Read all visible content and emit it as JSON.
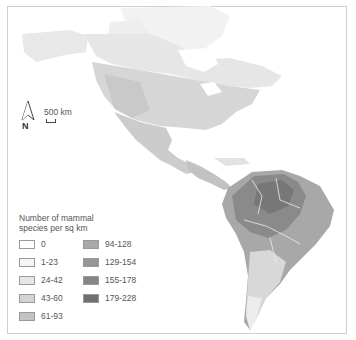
{
  "map": {
    "subject": "Number of mammal species per sq km across the Americas",
    "north_arrow_label": "N",
    "scale_label": "500 km",
    "colors": {
      "frame_border": "#cfcfcf",
      "ocean": "#ffffff",
      "greenland": "#f2f2f2",
      "canada_north": "#ececec",
      "north_america": "#dddddd",
      "usa_west": "#cfcfcf",
      "central_america": "#c8c8c8",
      "amazon": "#8e8e8e",
      "brazil_east": "#a8a8a8",
      "southern_cone": "#dcdcdc",
      "patagonia": "#eeeeee"
    }
  },
  "legend": {
    "title": "Number of mammal species per sq km",
    "items": [
      {
        "label": "0",
        "color": "#ffffff"
      },
      {
        "label": "1-23",
        "color": "#f5f5f5"
      },
      {
        "label": "24-42",
        "color": "#e6e6e6"
      },
      {
        "label": "43-60",
        "color": "#d3d3d3"
      },
      {
        "label": "61-93",
        "color": "#c2c2c2"
      },
      {
        "label": "94-128",
        "color": "#a9a9a9"
      },
      {
        "label": "129-154",
        "color": "#969696"
      },
      {
        "label": "155-178",
        "color": "#858585"
      },
      {
        "label": "179-228",
        "color": "#6f6f6f"
      }
    ]
  }
}
